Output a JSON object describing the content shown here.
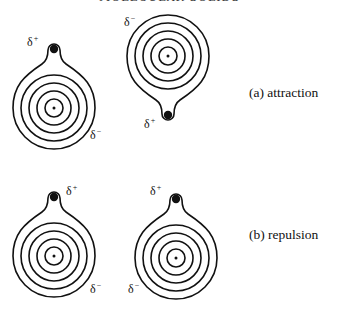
{
  "header": {
    "title": "MOLECULAR SOLIDS"
  },
  "colors": {
    "stroke": "#111111",
    "background": "#ffffff"
  },
  "labels": {
    "delta": "δ",
    "plus": "+",
    "minus": "−"
  },
  "panels": [
    {
      "id": "a",
      "caption": "(a) attraction",
      "molecules": [
        {
          "id": "a-left",
          "orientation": "tail-up",
          "delta_plus": "δ+",
          "delta_minus": "δ−"
        },
        {
          "id": "a-right",
          "orientation": "tail-down",
          "delta_plus": "δ+",
          "delta_minus": "δ−"
        }
      ]
    },
    {
      "id": "b",
      "caption": "(b) repulsion",
      "molecules": [
        {
          "id": "b-left",
          "orientation": "tail-up",
          "delta_plus": "δ+",
          "delta_minus": "δ−"
        },
        {
          "id": "b-right",
          "orientation": "tail-up",
          "delta_plus": "δ+",
          "delta_minus": "δ−"
        }
      ]
    }
  ]
}
